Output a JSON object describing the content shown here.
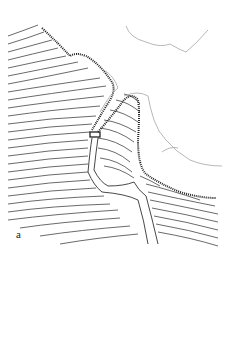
{
  "figure": {
    "panel_label": "a",
    "colors": {
      "ink": "#333333",
      "faint": "#999999",
      "background": "#ffffff"
    }
  }
}
